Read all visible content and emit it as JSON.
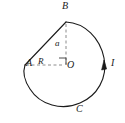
{
  "figure": {
    "kind": "geometry-diagram",
    "stroke_color": "#1a1a1a",
    "dash_color": "#8c8c8c",
    "background_color": "#ffffff",
    "points": {
      "A": {
        "label": "A",
        "x": 25,
        "y": 65
      },
      "B": {
        "label": "B",
        "x": 66,
        "y": 22
      },
      "O": {
        "label": "O",
        "x": 66,
        "y": 65
      },
      "I": {
        "label": "I",
        "x": 104,
        "y": 65
      },
      "C": {
        "label": "C",
        "x": 73,
        "y": 104
      }
    },
    "segments": {
      "chord_AB": {
        "from": "A",
        "to": "B",
        "style": "solid"
      },
      "radius_AO": {
        "from": "A",
        "to": "O",
        "style": "dashed",
        "label": "R"
      },
      "height_BO": {
        "from": "B",
        "to": "O",
        "style": "dashed",
        "label": "a"
      }
    },
    "arc": {
      "from": "B",
      "through": [
        "I",
        "C"
      ],
      "to": "A",
      "style": "solid",
      "direction": "clockwise"
    },
    "markers": {
      "right_angle": {
        "at": "O",
        "symbol": "square"
      },
      "arrowhead": {
        "on": "arc",
        "at": "I",
        "direction": "downward"
      }
    },
    "labels": {
      "A": "A",
      "B": "B",
      "C": "C",
      "I": "I",
      "O": "O",
      "R": "R",
      "a": "a"
    }
  }
}
